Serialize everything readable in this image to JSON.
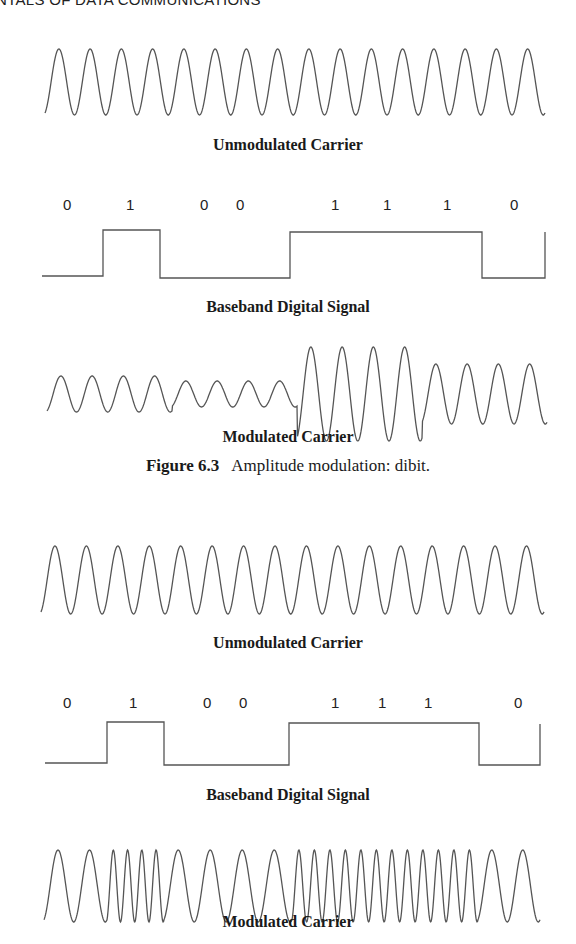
{
  "page": {
    "running_header": "NTALS OF DATA COMMUNICATIONS"
  },
  "figure_6_3": {
    "unmodulated_label": "Unmodulated Carrier",
    "baseband_label": "Baseband Digital Signal",
    "modulated_label": "Modulated Carrier",
    "bits": [
      "0",
      "1",
      "0",
      "0",
      "1",
      "1",
      "1",
      "0"
    ],
    "caption_number": "Figure 6.3",
    "caption_text": "Amplitude modulation: dibit."
  },
  "figure_6_4": {
    "unmodulated_label": "Unmodulated Carrier",
    "baseband_label": "Baseband Digital Signal",
    "modulated_label": "Modulated Carrier",
    "bits": [
      "0",
      "1",
      "0",
      "0",
      "1",
      "1",
      "1",
      "0"
    ]
  },
  "colors": {
    "ink": "#555555",
    "text": "#1a1a1a",
    "background": "#ffffff"
  }
}
